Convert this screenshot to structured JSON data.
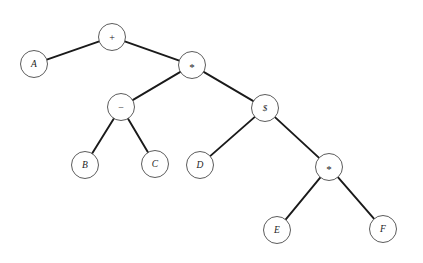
{
  "diagram": {
    "background_color": "#ffffff",
    "node_fill": "#ffffff",
    "node_stroke": "#4a4a4a",
    "edge_color": "#1a1a1a",
    "node_radius": 13.5,
    "expression": "A + ( ( B - C ) * ( D $ ( E * F ) ) )"
  },
  "nodes": [
    {
      "id": "n-plus",
      "label": "+",
      "kind": "operator",
      "x": 112,
      "y": 37,
      "glyph": "plus-sign"
    },
    {
      "id": "n-a",
      "label": "A",
      "kind": "operand",
      "x": 34,
      "y": 64,
      "glyph": "letter-a"
    },
    {
      "id": "n-star1",
      "label": "*",
      "kind": "operator",
      "x": 192,
      "y": 65,
      "glyph": "asterisk-sign"
    },
    {
      "id": "n-minus",
      "label": "−",
      "kind": "operator",
      "x": 121,
      "y": 107,
      "glyph": "minus-sign"
    },
    {
      "id": "n-dollar",
      "label": "$",
      "kind": "operator",
      "x": 265,
      "y": 108,
      "glyph": "dollar-sign"
    },
    {
      "id": "n-b",
      "label": "B",
      "kind": "operand",
      "x": 85,
      "y": 165,
      "glyph": "letter-b"
    },
    {
      "id": "n-c",
      "label": "C",
      "kind": "operand",
      "x": 155,
      "y": 164,
      "glyph": "letter-c"
    },
    {
      "id": "n-d",
      "label": "D",
      "kind": "operand",
      "x": 200,
      "y": 165,
      "glyph": "letter-d"
    },
    {
      "id": "n-star2",
      "label": "*",
      "kind": "operator",
      "x": 329,
      "y": 167,
      "glyph": "asterisk-sign"
    },
    {
      "id": "n-e",
      "label": "E",
      "kind": "operand",
      "x": 277,
      "y": 230,
      "glyph": "letter-e"
    },
    {
      "id": "n-f",
      "label": "F",
      "kind": "operand",
      "x": 383,
      "y": 229,
      "glyph": "letter-f"
    }
  ],
  "edges": [
    {
      "id": "e-plus-a",
      "from": "n-plus",
      "to": "n-a"
    },
    {
      "id": "e-plus-star1",
      "from": "n-plus",
      "to": "n-star1"
    },
    {
      "id": "e-star1-minus",
      "from": "n-star1",
      "to": "n-minus"
    },
    {
      "id": "e-star1-dollar",
      "from": "n-star1",
      "to": "n-dollar"
    },
    {
      "id": "e-minus-b",
      "from": "n-minus",
      "to": "n-b"
    },
    {
      "id": "e-minus-c",
      "from": "n-minus",
      "to": "n-c"
    },
    {
      "id": "e-dollar-d",
      "from": "n-dollar",
      "to": "n-d"
    },
    {
      "id": "e-dollar-star2",
      "from": "n-dollar",
      "to": "n-star2"
    },
    {
      "id": "e-star2-e",
      "from": "n-star2",
      "to": "n-e"
    },
    {
      "id": "e-star2-f",
      "from": "n-star2",
      "to": "n-f"
    }
  ]
}
